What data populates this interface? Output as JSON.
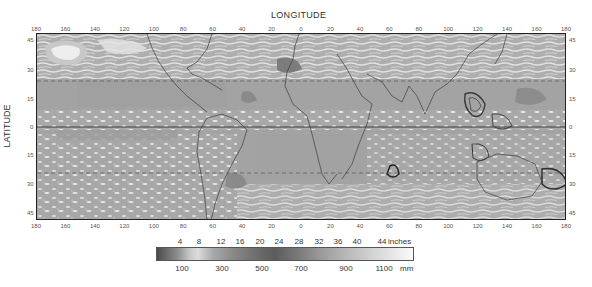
{
  "map": {
    "x_axis_title": "LONGITUDE",
    "y_axis_title": "LATITUDE",
    "longitude_ticks": [
      "180",
      "160",
      "140",
      "120",
      "100",
      "80",
      "60",
      "40",
      "20",
      "0",
      "20",
      "40",
      "60",
      "80",
      "100",
      "120",
      "140",
      "160",
      "180"
    ],
    "latitude_ticks_left": [
      "45",
      "30",
      "15",
      "0",
      "15",
      "30",
      "45"
    ],
    "latitude_ticks_right": [
      "45",
      "30",
      "15",
      "0",
      "15",
      "30",
      "45"
    ],
    "reference_lines": {
      "equator": "solid",
      "tropic_of_cancer": "dashed",
      "tropic_of_capricorn": "dashed"
    },
    "colors": {
      "background_gray": "#a4a4a4",
      "light_gray": "#d8d8d8",
      "white_patch": "#f2f2f2",
      "dark_patch": "#5a5a5a",
      "frame": "#222222"
    }
  },
  "legend": {
    "inches_ticks": [
      "4",
      "8",
      "12",
      "16",
      "20",
      "24",
      "28",
      "32",
      "36",
      "40",
      "44"
    ],
    "inches_unit": "inches",
    "mm_ticks": [
      "100",
      "300",
      "500",
      "700",
      "900",
      "1100"
    ],
    "mm_unit": "mm",
    "gradient_stops": [
      "#4a4a4a",
      "#8c8c8c",
      "#d6d6d6",
      "#9a9a9a",
      "#6a6a6a",
      "#5a5a5a",
      "#8a8a8a",
      "#b4b4b4",
      "#d8d8d8",
      "#f0f0f0",
      "#ffffff"
    ]
  }
}
